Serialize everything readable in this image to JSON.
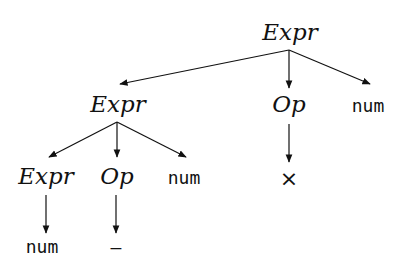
{
  "diagram": {
    "type": "parse-tree",
    "nodes": {
      "root": {
        "label": "Expr",
        "kind": "nonterminal"
      },
      "n1": {
        "label": "Expr",
        "kind": "nonterminal"
      },
      "n2": {
        "label": "Op",
        "kind": "nonterminal"
      },
      "n3": {
        "label": "num",
        "kind": "terminal"
      },
      "n4": {
        "label": "Expr",
        "kind": "nonterminal"
      },
      "n5": {
        "label": "Op",
        "kind": "nonterminal"
      },
      "n6": {
        "label": "num",
        "kind": "terminal"
      },
      "n7": {
        "label": "×",
        "kind": "terminal"
      },
      "n8": {
        "label": "num",
        "kind": "terminal"
      },
      "n9": {
        "label": "–",
        "kind": "terminal"
      }
    },
    "edges": [
      [
        "root",
        "n1"
      ],
      [
        "root",
        "n2"
      ],
      [
        "root",
        "n3"
      ],
      [
        "n1",
        "n4"
      ],
      [
        "n1",
        "n5"
      ],
      [
        "n1",
        "n6"
      ],
      [
        "n2",
        "n7"
      ],
      [
        "n4",
        "n8"
      ],
      [
        "n5",
        "n9"
      ]
    ]
  }
}
